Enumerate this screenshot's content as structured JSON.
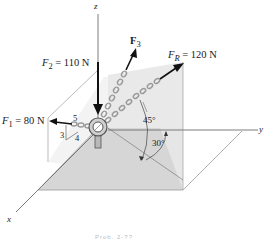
{
  "figure": {
    "axes": {
      "z": "z",
      "x": "x",
      "y": "y"
    },
    "forces": {
      "f1": {
        "symbol": "F",
        "sub": "1",
        "value": " = 80 N"
      },
      "f2": {
        "symbol": "F",
        "sub": "2",
        "value": " = 110 N"
      },
      "f3": {
        "symbol": "F",
        "sub": "3",
        "value": ""
      },
      "fr": {
        "symbol": "F",
        "sub": "R",
        "value": " = 120 N"
      }
    },
    "slope_triangle": {
      "hyp": "5",
      "vert": "3",
      "horiz": "4"
    },
    "angles": {
      "a45": "45°",
      "a30": "30°"
    },
    "caption": "Prob. 2-??"
  },
  "colors": {
    "plane_shade": "#d9d9d9",
    "wall_shade": "#ebebeb",
    "line": "#7a7a7a",
    "arrow": "#111111",
    "chain": "#9a9a9a"
  }
}
